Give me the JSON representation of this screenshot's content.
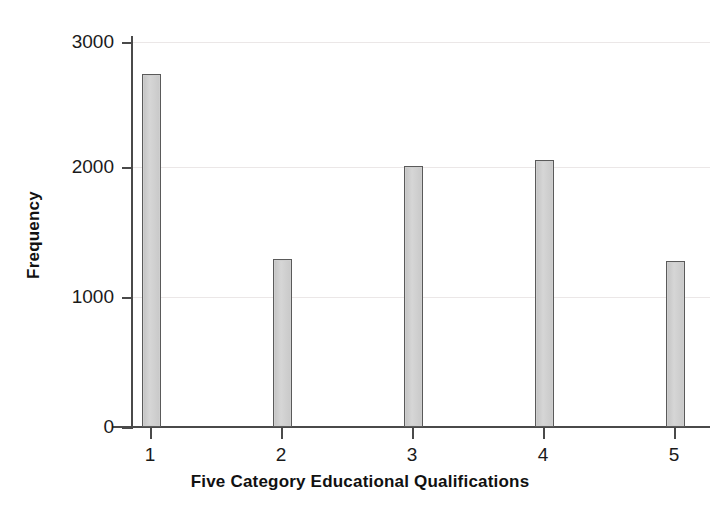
{
  "chart_data": {
    "type": "bar",
    "title": "",
    "xlabel": "Five Category Educational Qualifications",
    "ylabel": "Frequency",
    "categories": [
      "1",
      "2",
      "3",
      "4",
      "5"
    ],
    "values": [
      2750,
      1310,
      2030,
      2080,
      1290
    ],
    "series": [
      {
        "name": "Frequency",
        "values": [
          2750,
          1310,
          2030,
          2080,
          1290
        ]
      }
    ],
    "ylim": [
      0,
      3000
    ],
    "yticks": [
      0,
      1000,
      2000,
      3000
    ],
    "ytick_labels": [
      "0",
      "1000",
      "2000",
      "3000"
    ],
    "xtick_labels": [
      "1",
      "2",
      "3",
      "4",
      "5"
    ],
    "grid": "horizontal",
    "legend": "none",
    "bar_fill_color": "#cfcfcf",
    "bar_edge_color": "#5a5a5a",
    "axis_color": "#4a4a4a",
    "grid_color": "#ebe7e7",
    "background_color": "#ffffff"
  }
}
